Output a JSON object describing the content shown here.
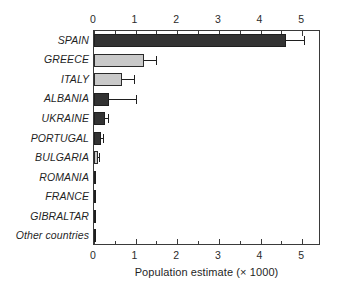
{
  "chart_data": {
    "type": "bar",
    "orientation": "horizontal",
    "title": "",
    "subtitle": "",
    "xlabel": "Population estimate (× 1000)",
    "ylabel": "",
    "xlim": [
      0,
      5.45
    ],
    "x_major_ticks": [
      0,
      1,
      2,
      3,
      4,
      5
    ],
    "x_major_tick_labels": [
      "0",
      "1",
      "2",
      "3",
      "4",
      "5"
    ],
    "x_minor_tick_step": 0.5,
    "grid": false,
    "legend": null,
    "axes_positions": [
      "top",
      "bottom"
    ],
    "categories": [
      "SPAIN",
      "GREECE",
      "ITALY",
      "ALBANIA",
      "UKRAINE",
      "PORTUGAL",
      "BULGARIA",
      "ROMANIA",
      "FRANCE",
      "GIBRALTAR",
      "Other countries"
    ],
    "values": [
      4.6,
      1.2,
      0.68,
      0.35,
      0.26,
      0.17,
      0.1,
      0.06,
      0.03,
      0.02,
      0.02
    ],
    "error_upper": [
      5.05,
      1.5,
      0.95,
      1.0,
      0.33,
      0.21,
      0.13,
      null,
      null,
      null,
      null
    ],
    "bar_fill_colors": [
      "#333333",
      "#c9c9c9",
      "#c9c9c9",
      "#333333",
      "#333333",
      "#333333",
      "#c9c9c9",
      "#333333",
      "#333333",
      "#333333",
      "#333333"
    ],
    "bar_shades": [
      "dark",
      "light",
      "light",
      "dark",
      "dark",
      "dark",
      "light",
      "dark",
      "dark",
      "dark",
      "dark"
    ],
    "colors": {
      "dark_bar": "#333333",
      "light_bar": "#c9c9c9",
      "bar_outline": "#2a2a2a",
      "axis": "#3a3a3a",
      "text": "#1f1f1f",
      "background": "#ffffff"
    }
  }
}
